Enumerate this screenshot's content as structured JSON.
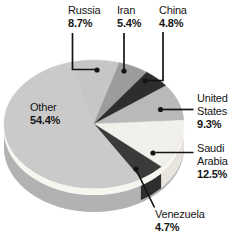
{
  "chart_data": {
    "type": "pie",
    "style": "3d",
    "start_angle_deg": -15,
    "unit": "%",
    "slices": [
      {
        "label": "Russia",
        "value": 8.7,
        "color": "#c6c6c6"
      },
      {
        "label": "Iran",
        "value": 5.4,
        "color": "#9c9c9c"
      },
      {
        "label": "China",
        "value": 4.8,
        "color": "#2d2d2d"
      },
      {
        "label": "United States",
        "value": 9.3,
        "color": "#b9b9b9"
      },
      {
        "label": "Saudi Arabia",
        "value": 12.5,
        "color": "#f2f0ea",
        "side_color": "#e8e5de"
      },
      {
        "label": "Venezuela",
        "value": 4.7,
        "color": "#3a3a3a",
        "side_color": "#2e2e2e"
      },
      {
        "label": "Other",
        "value": 54.4,
        "color": "#cacaca",
        "side_color": "#b2b2b2"
      }
    ],
    "rim_highlight_color": "#f7f5f0",
    "base_color": "#b2b2b2",
    "leader_color": "#141414"
  },
  "labels": {
    "russia": {
      "line1": "Russia",
      "line2": "8.7%"
    },
    "iran": {
      "line1": "Iran",
      "line2": "5.4%"
    },
    "china": {
      "line1": "China",
      "line2": "4.8%"
    },
    "united_states": {
      "line1": "United",
      "line2": "States",
      "line3": "9.3%"
    },
    "saudi_arabia": {
      "line1": "Saudi",
      "line2": "Arabia",
      "line3": "12.5%"
    },
    "venezuela": {
      "line1": "Venezuela",
      "line2": "4.7%"
    },
    "other": {
      "line1": "Other",
      "line2": "54.4%"
    }
  }
}
